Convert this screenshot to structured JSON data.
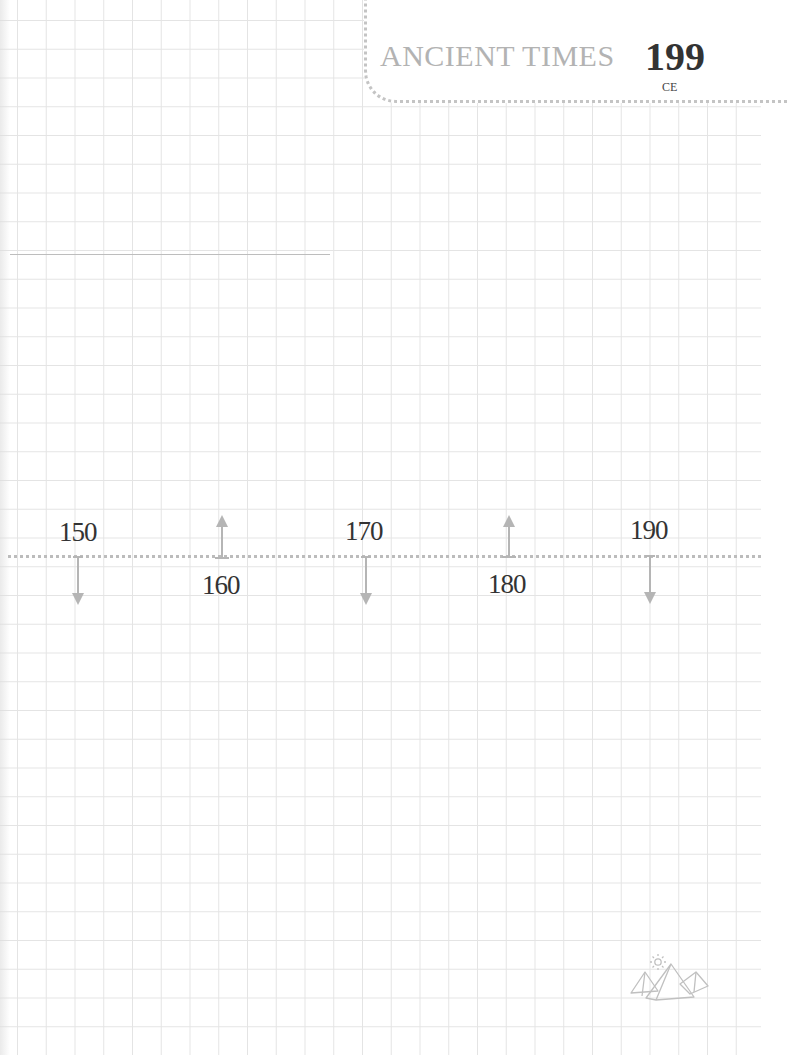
{
  "header": {
    "title": "ANCIENT TIMES",
    "year": "199",
    "era": "CE"
  },
  "timeline": {
    "ticks": [
      {
        "label": "150",
        "direction": "down"
      },
      {
        "label": "160",
        "direction": "up"
      },
      {
        "label": "170",
        "direction": "down"
      },
      {
        "label": "180",
        "direction": "up"
      },
      {
        "label": "190",
        "direction": "down"
      }
    ]
  },
  "decor": {
    "footer_icon": "pyramids-with-sun-icon"
  },
  "colors": {
    "grid": "#e4e4e4",
    "dotted": "#bcbcbc",
    "arrow": "#b5b5b5",
    "title": "#b3b3b3",
    "text": "#333333"
  }
}
